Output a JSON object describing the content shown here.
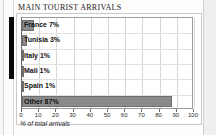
{
  "window": {
    "scrollbar_name": "vertical-scrollbar"
  },
  "chart_data": {
    "type": "bar",
    "orientation": "horizontal",
    "title": "MAIN TOURIST ARRIVALS",
    "xlabel": "% of total arrivals",
    "ylabel": "",
    "xlim": [
      0,
      100
    ],
    "xticks": [
      "0",
      "10",
      "20",
      "30",
      "40",
      "50",
      "60",
      "70",
      "80",
      "90",
      "100"
    ],
    "grid": true,
    "legend": "none",
    "bar_color": "#8b8b8b",
    "categories": [
      "France",
      "Tunisia",
      "Italy",
      "Mali",
      "Spain",
      "Other"
    ],
    "values": [
      7,
      3,
      1,
      1,
      1,
      87
    ],
    "data_labels": [
      "France 7%",
      "Tunisia 3%",
      "Italy 1%",
      "Mali 1%",
      "Spain 1%",
      "Other 87%"
    ]
  }
}
